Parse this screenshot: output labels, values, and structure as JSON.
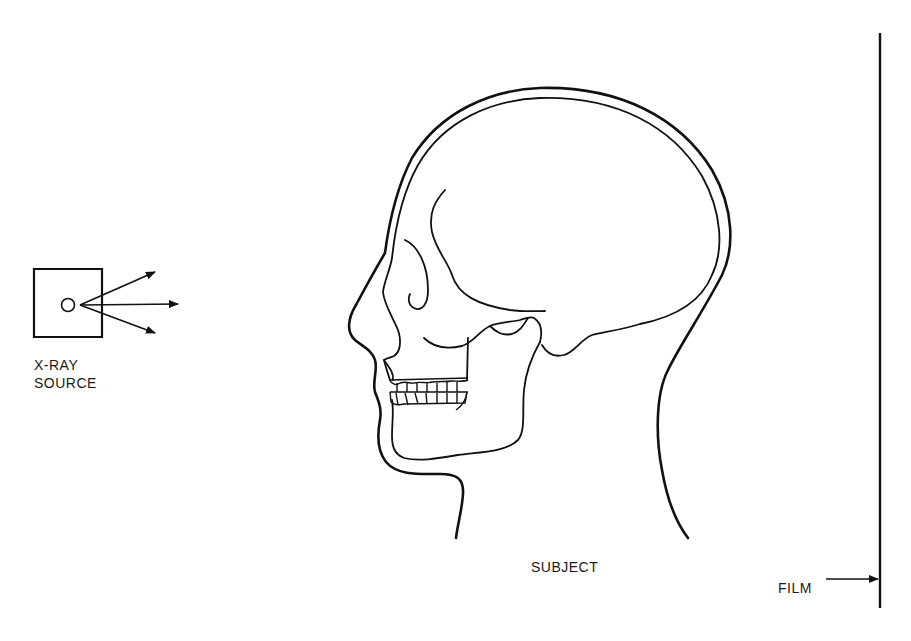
{
  "diagram": {
    "colors": {
      "ink": "#111111",
      "background": "#ffffff"
    },
    "labels": {
      "source_line1": "X-RAY",
      "source_line2": "SOURCE",
      "subject": "SUBJECT",
      "film": "FILM"
    },
    "components": [
      {
        "id": "xray-source",
        "shape": "square-with-circle",
        "rays": 3
      },
      {
        "id": "subject",
        "shape": "skull-profile-in-head-outline",
        "facing": "left"
      },
      {
        "id": "film",
        "shape": "vertical-line"
      }
    ]
  }
}
